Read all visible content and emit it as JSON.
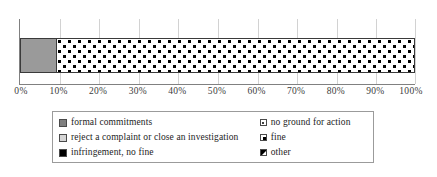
{
  "chart_data": {
    "type": "bar",
    "orientation": "horizontal",
    "stacked": true,
    "title": "",
    "xlabel": "",
    "ylabel": "",
    "categories": [
      ""
    ],
    "xlim": [
      0,
      100
    ],
    "grid": true,
    "tick_labels": [
      "0%",
      "10%",
      "20%",
      "30%",
      "40%",
      "50%",
      "60%",
      "70%",
      "80%",
      "90%",
      "100%"
    ],
    "tick_values": [
      0,
      10,
      20,
      30,
      40,
      50,
      60,
      70,
      80,
      90,
      100
    ],
    "legend_position": "bottom",
    "series": [
      {
        "name": "formal commitments",
        "values": [
          0
        ],
        "color": "#808080",
        "pattern": "solid"
      },
      {
        "name": "reject a complaint or close an investigation",
        "values": [
          9
        ],
        "color": "#9a9a9a",
        "pattern": "solid"
      },
      {
        "name": "infringement, no fine",
        "values": [
          0
        ],
        "color": "#000000",
        "pattern": "solid"
      },
      {
        "name": "no ground for action",
        "values": [
          91
        ],
        "color": "#ffffff",
        "pattern": "dots"
      },
      {
        "name": "fine",
        "values": [
          0
        ],
        "color": "#ffffff",
        "pattern": "corner"
      },
      {
        "name": "other",
        "values": [
          0
        ],
        "color": "#ffffff",
        "pattern": "diagonal"
      }
    ]
  },
  "axis": {
    "ticks": [
      {
        "label": "0%",
        "value": 0
      },
      {
        "label": "10%",
        "value": 10
      },
      {
        "label": "20%",
        "value": 20
      },
      {
        "label": "30%",
        "value": 30
      },
      {
        "label": "40%",
        "value": 40
      },
      {
        "label": "50%",
        "value": 50
      },
      {
        "label": "60%",
        "value": 60
      },
      {
        "label": "70%",
        "value": 70
      },
      {
        "label": "80%",
        "value": 80
      },
      {
        "label": "90%",
        "value": 90
      },
      {
        "label": "100%",
        "value": 100
      }
    ]
  },
  "bar": {
    "segments": [
      {
        "name": "reject a complaint or close an investigation",
        "value": 9
      },
      {
        "name": "no ground for action",
        "value": 91
      }
    ]
  },
  "legend": {
    "left_column": [
      {
        "label": "formal commitments",
        "swatch": "solid-dark-gray-square-icon"
      },
      {
        "label": "reject a complaint or close an investigation",
        "swatch": "solid-light-gray-square-icon"
      },
      {
        "label": "infringement, no fine",
        "swatch": "solid-black-square-icon"
      }
    ],
    "right_column": [
      {
        "label": "no ground for action",
        "swatch": "dotted-square-icon"
      },
      {
        "label": "fine",
        "swatch": "corner-filled-square-icon"
      },
      {
        "label": "other",
        "swatch": "diagonal-split-square-icon"
      }
    ]
  }
}
